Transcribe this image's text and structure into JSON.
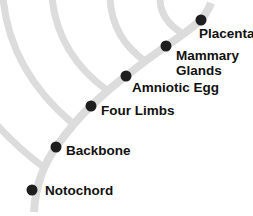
{
  "diagram": {
    "type": "cladogram",
    "colors": {
      "branch": "#dcdcdc",
      "node": "#1e1e1e",
      "text": "#111111",
      "background": "#ffffff"
    },
    "nodes": [
      {
        "id": "notochord",
        "label": "Notochord",
        "cx": 32,
        "cy": 190,
        "label_x": 45,
        "label_y": 183
      },
      {
        "id": "backbone",
        "label": "Backbone",
        "cx": 56,
        "cy": 147,
        "label_x": 66,
        "label_y": 143
      },
      {
        "id": "four-limbs",
        "label": "Four Limbs",
        "cx": 91,
        "cy": 106,
        "label_x": 101,
        "label_y": 103
      },
      {
        "id": "amniotic-egg",
        "label": "Amniotic Egg",
        "cx": 126,
        "cy": 76,
        "label_x": 132,
        "label_y": 80
      },
      {
        "id": "mammary-glands",
        "label": "Mammary Glands",
        "label_line1": "Mammary",
        "label_line2": "Glands",
        "cx": 166,
        "cy": 46,
        "label_x": 176,
        "label_y": 48
      },
      {
        "id": "placenta",
        "label": "Placenta",
        "cx": 201,
        "cy": 20,
        "label_x": 199,
        "label_y": 26
      }
    ]
  }
}
